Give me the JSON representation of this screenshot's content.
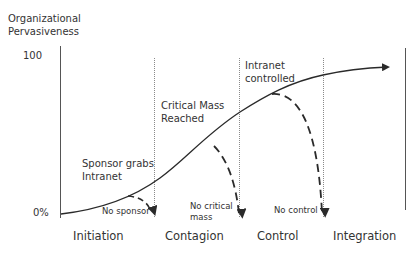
{
  "diagram": {
    "y_axis": {
      "title_line1": "Organizational",
      "title_line2": "Pervasiveness",
      "tick_top": "100",
      "tick_bottom": "0%"
    },
    "phases": [
      {
        "label": "Initiation"
      },
      {
        "label": "Contagion"
      },
      {
        "label": "Control"
      },
      {
        "label": "Integration"
      }
    ],
    "milestones": [
      {
        "line1": "Sponsor grabs",
        "line2": "Intranet"
      },
      {
        "line1": "Critical Mass",
        "line2": "Reached"
      },
      {
        "line1": "Intranet",
        "line2": "controlled"
      }
    ],
    "failures": [
      {
        "line1": "No sponsor"
      },
      {
        "line1": "No critical",
        "line2": "mass"
      },
      {
        "line1": "No control"
      }
    ],
    "colors": {
      "line": "#2a2a2a",
      "dotted": "#8a8a8a",
      "text": "#333333"
    }
  }
}
